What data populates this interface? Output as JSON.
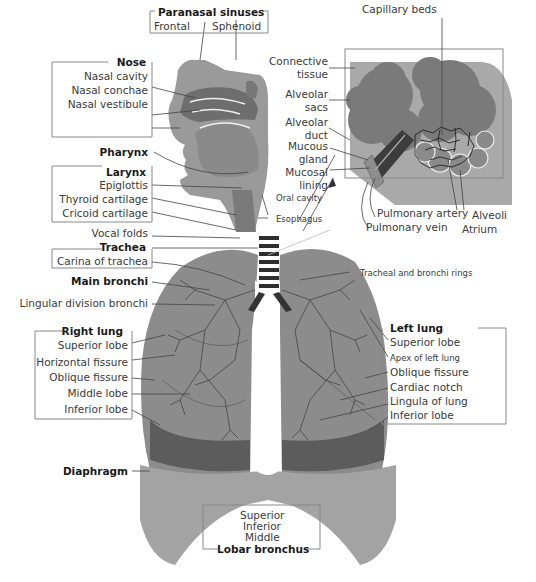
{
  "diagram": {
    "colors": {
      "tissue_dark": "#6f6f6f",
      "tissue_mid": "#8e8e8e",
      "tissue_light": "#b5b5b5",
      "line": "#444444",
      "box_border": "#888888",
      "background": "#ffffff"
    },
    "head": {
      "paranasal_sinuses": {
        "title": "Paranasal sinuses",
        "items": [
          "Frontal",
          "Sphenoid"
        ]
      },
      "nose": {
        "title": "Nose",
        "items": [
          "Nasal cavity",
          "Nasal conchae",
          "Nasal vestibule"
        ]
      },
      "pharynx": "Pharynx",
      "larynx": {
        "title": "Larynx",
        "items": [
          "Epiglottis",
          "Thyroid cartilage",
          "Cricoid cartilage"
        ]
      },
      "vocal_folds": "Vocal folds",
      "oral_cavity": "Oral cavity",
      "esophagus": "Esophagus"
    },
    "airway": {
      "trachea": {
        "title": "Trachea",
        "items": [
          "Carina of trachea"
        ]
      },
      "main_bronchi": "Main bronchi",
      "lingular_division_bronchi": "Lingular division bronchi",
      "tracheal_rings": "Tracheal and bronchi rings"
    },
    "inset": {
      "capillary_beds": "Capillary beds",
      "connective_tissue": "Connective tissue",
      "alveolar_sacs": "Alveolar sacs",
      "alveolar_duct": "Alveolar duct",
      "mucous_gland": "Mucous gland",
      "mucosal_lining": "Mucosal lining",
      "pulmonary_artery": "Pulmonary artery",
      "pulmonary_vein": "Pulmonary vein",
      "alveoli": "Alveoli",
      "atrium": "Atrium"
    },
    "right_lung": {
      "title": "Right lung",
      "items": [
        "Superior lobe",
        "Horizontal fissure",
        "Oblique fissure",
        "Middle lobe",
        "Inferior lobe"
      ]
    },
    "left_lung": {
      "title": "Left lung",
      "items": [
        "Superior lobe",
        "Apex of left lung",
        "Oblique fissure",
        "Cardiac notch",
        "Lingula of lung",
        "Inferior lobe"
      ]
    },
    "diaphragm": "Diaphragm",
    "lobar_bronchus": {
      "title": "Lobar bronchus",
      "items": [
        "Superior",
        "Inferior",
        "Middle"
      ]
    }
  }
}
